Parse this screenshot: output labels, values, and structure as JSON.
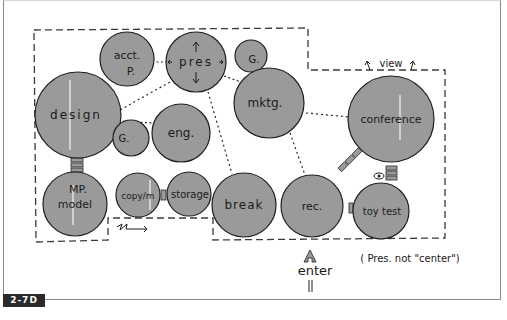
{
  "figure_label": "2-7D",
  "annotations": {
    "view": "view",
    "enter": "enter",
    "note": "( Pres. not \"center\")"
  },
  "colors": {
    "bubble_fill": "#9a9a9a",
    "bubble_stroke": "#1f1f1f",
    "boundary": "#3a3a3a",
    "frame": "#8a8a8a",
    "label_bg": "#2a2a2a"
  },
  "bubbles": [
    {
      "id": "acct",
      "label": "acct.",
      "sublabel": "P.",
      "cx": 127,
      "cy": 59,
      "r": 27
    },
    {
      "id": "pres",
      "label": "pres",
      "cx": 196,
      "cy": 62,
      "r": 30
    },
    {
      "id": "g-top",
      "label": "G.",
      "cx": 251,
      "cy": 56,
      "r": 16
    },
    {
      "id": "design",
      "label": "design",
      "cx": 78,
      "cy": 115,
      "r": 43
    },
    {
      "id": "g-mid",
      "label": "G.",
      "cx": 131,
      "cy": 138,
      "r": 18
    },
    {
      "id": "eng",
      "label": "eng.",
      "cx": 181,
      "cy": 133,
      "r": 29
    },
    {
      "id": "mktg",
      "label": "mktg.",
      "cx": 269,
      "cy": 103,
      "r": 35
    },
    {
      "id": "conference",
      "label": "conference",
      "cx": 391,
      "cy": 119,
      "r": 43
    },
    {
      "id": "mp-model",
      "label": "MP.",
      "sublabel": "model",
      "cx": 75,
      "cy": 204,
      "r": 32
    },
    {
      "id": "copy",
      "label": "copy/m",
      "cx": 138,
      "cy": 195,
      "r": 22
    },
    {
      "id": "storage",
      "label": "storage",
      "cx": 189,
      "cy": 194,
      "r": 22
    },
    {
      "id": "break",
      "label": "break",
      "cx": 244,
      "cy": 205,
      "r": 32
    },
    {
      "id": "rec",
      "label": "rec.",
      "cx": 312,
      "cy": 206,
      "r": 31
    },
    {
      "id": "toy-test",
      "label": "toy test",
      "cx": 381,
      "cy": 211,
      "r": 28
    }
  ],
  "connections": [
    {
      "from": "acct",
      "to": "pres",
      "type": "dots"
    },
    {
      "from": "pres",
      "to": "mktg",
      "type": "dots"
    },
    {
      "from": "pres",
      "to": "design",
      "type": "dots"
    },
    {
      "from": "pres",
      "to": "break",
      "type": "dots"
    },
    {
      "from": "design",
      "to": "g-mid",
      "type": "dots"
    },
    {
      "from": "mktg",
      "to": "conference",
      "type": "dots"
    },
    {
      "from": "mktg",
      "to": "rec",
      "type": "dots"
    },
    {
      "from": "design",
      "to": "mp-model",
      "type": "bars"
    },
    {
      "from": "copy",
      "to": "storage",
      "type": "bars"
    },
    {
      "from": "rec",
      "to": "conference",
      "type": "bars"
    },
    {
      "from": "rec",
      "to": "toy-test",
      "type": "bars"
    },
    {
      "from": "conference",
      "to": "toy-test",
      "type": "bars"
    }
  ]
}
